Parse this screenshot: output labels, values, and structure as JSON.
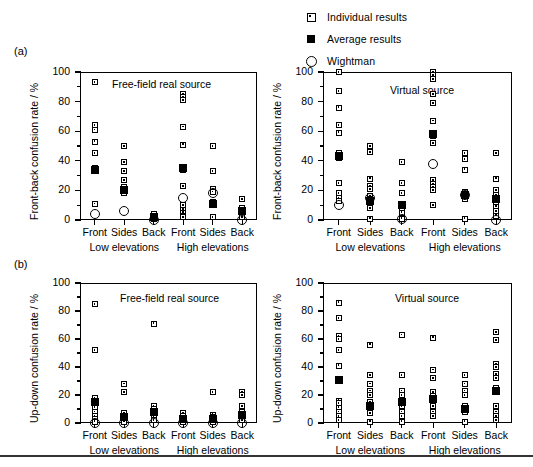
{
  "legend": {
    "items": [
      {
        "icon": "open-square-dot-icon",
        "label": "Individual results"
      },
      {
        "icon": "filled-square-icon",
        "label": "Average results"
      },
      {
        "icon": "open-circle-icon",
        "label": "Wightman"
      }
    ]
  },
  "panels": [
    {
      "tag": "(a)"
    },
    {
      "tag": "(b)"
    }
  ],
  "axis": {
    "yticks": [
      "0",
      "20",
      "40",
      "60",
      "80",
      "100"
    ],
    "categories": [
      "Front",
      "Sides",
      "Back",
      "Front",
      "Sides",
      "Back"
    ],
    "groups": [
      "Low elevations",
      "High elevations"
    ],
    "ylabel_fb": "Front-back confusion rate / %",
    "ylabel_ud": "Up-down confusion rate / %"
  },
  "titles": {
    "real": "Free-field real source",
    "virtual": "Virtual source"
  },
  "chart_data": [
    {
      "id": "a-left",
      "type": "scatter",
      "panel": "(a)",
      "title": "Free-field real source",
      "xlabel": "",
      "ylabel": "Front-back confusion rate / %",
      "ylim": [
        0,
        100
      ],
      "yticks": [
        0,
        20,
        40,
        60,
        80,
        100
      ],
      "grid": false,
      "categories": [
        "Front",
        "Sides",
        "Back",
        "Front",
        "Sides",
        "Back"
      ],
      "groups": [
        "Low elevations",
        "High elevations"
      ],
      "series": [
        {
          "name": "Individual results",
          "values_by_category": [
            [
              93,
              64,
              61,
              53,
              45,
              35,
              33,
              11
            ],
            [
              50,
              39,
              33,
              27,
              22,
              21,
              19,
              18
            ],
            [
              4,
              3,
              2,
              1
            ],
            [
              85,
              83,
              81,
              63,
              51,
              36,
              34,
              23,
              10,
              7,
              5,
              3,
              2
            ],
            [
              50,
              33,
              21,
              19,
              12,
              10,
              2
            ],
            [
              14,
              8,
              6,
              5,
              4,
              2
            ]
          ]
        },
        {
          "name": "Average results",
          "values_by_category": [
            [
              34
            ],
            [
              20
            ],
            [
              2
            ],
            [
              35
            ],
            [
              11
            ],
            [
              6
            ]
          ]
        },
        {
          "name": "Wightman",
          "values_by_category": [
            [
              4
            ],
            [
              6
            ],
            [
              0
            ],
            [
              15
            ],
            [
              18
            ],
            [
              0
            ]
          ]
        }
      ]
    },
    {
      "id": "a-right",
      "type": "scatter",
      "panel": "(a)",
      "title": "Virtual source",
      "xlabel": "",
      "ylabel": "Front-back confusion rate / %",
      "ylim": [
        0,
        100
      ],
      "yticks": [
        0,
        20,
        40,
        60,
        80,
        100
      ],
      "grid": false,
      "categories": [
        "Front",
        "Sides",
        "Back",
        "Front",
        "Sides",
        "Back"
      ],
      "groups": [
        "Low elevations",
        "High elevations"
      ],
      "series": [
        {
          "name": "Individual results",
          "values_by_category": [
            [
              100,
              87,
              76,
              64,
              59,
              45,
              42,
              25,
              18,
              15,
              13
            ],
            [
              50,
              46,
              28,
              23,
              21,
              16,
              14,
              11,
              8,
              1
            ],
            [
              39,
              25,
              18,
              11,
              8,
              5,
              1
            ],
            [
              100,
              98,
              95,
              85,
              79,
              67,
              59,
              57,
              52,
              27,
              24,
              22,
              20,
              10
            ],
            [
              45,
              41,
              34,
              19,
              16,
              14,
              1
            ],
            [
              45,
              28,
              20,
              17,
              15,
              12,
              9,
              6,
              3
            ]
          ]
        },
        {
          "name": "Average results",
          "values_by_category": [
            [
              43
            ],
            [
              13
            ],
            [
              10
            ],
            [
              58
            ],
            [
              17
            ],
            [
              14
            ]
          ]
        },
        {
          "name": "Wightman",
          "values_by_category": [
            [
              10
            ],
            [
              15
            ],
            [
              1
            ],
            [
              38
            ],
            [
              17
            ],
            [
              0
            ]
          ]
        }
      ]
    },
    {
      "id": "b-left",
      "type": "scatter",
      "panel": "(b)",
      "title": "Free-field real source",
      "xlabel": "",
      "ylabel": "Up-down confusion rate / %",
      "ylim": [
        0,
        100
      ],
      "yticks": [
        0,
        20,
        40,
        60,
        80,
        100
      ],
      "grid": false,
      "categories": [
        "Front",
        "Sides",
        "Back",
        "Front",
        "Sides",
        "Back"
      ],
      "groups": [
        "Low elevations",
        "High elevations"
      ],
      "series": [
        {
          "name": "Individual results",
          "values_by_category": [
            [
              85,
              52,
              18,
              16,
              14,
              11,
              8,
              5,
              3,
              1
            ],
            [
              28,
              22,
              7,
              5,
              3,
              1
            ],
            [
              71,
              12,
              10,
              8,
              6,
              4,
              2
            ],
            [
              7,
              5,
              3,
              1
            ],
            [
              22,
              6,
              4,
              2,
              1
            ],
            [
              22,
              20,
              12,
              8,
              6,
              4,
              2
            ]
          ]
        },
        {
          "name": "Average results",
          "values_by_category": [
            [
              15
            ],
            [
              4
            ],
            [
              8
            ],
            [
              3
            ],
            [
              3
            ],
            [
              6
            ]
          ]
        },
        {
          "name": "Wightman",
          "values_by_category": [
            [
              0
            ],
            [
              0
            ],
            [
              0
            ],
            [
              0
            ],
            [
              0
            ],
            [
              0
            ]
          ]
        }
      ]
    },
    {
      "id": "b-right",
      "type": "scatter",
      "panel": "(b)",
      "title": "Virtual source",
      "xlabel": "",
      "ylabel": "Up-down confusion rate / %",
      "ylim": [
        0,
        100
      ],
      "yticks": [
        0,
        20,
        40,
        60,
        80,
        100
      ],
      "grid": false,
      "categories": [
        "Front",
        "Sides",
        "Back",
        "Front",
        "Sides",
        "Back"
      ],
      "groups": [
        "Low elevations",
        "High elevations"
      ],
      "series": [
        {
          "name": "Individual results",
          "values_by_category": [
            [
              86,
              75,
              62,
              60,
              52,
              41,
              16,
              14,
              11,
              8,
              5,
              2
            ],
            [
              56,
              34,
              28,
              23,
              20,
              15,
              10,
              7,
              1
            ],
            [
              63,
              34,
              23,
              20,
              12,
              8,
              5,
              1
            ],
            [
              61,
              38,
              32,
              22,
              19,
              12,
              8,
              5
            ],
            [
              34,
              28,
              23,
              20,
              12,
              8,
              1
            ],
            [
              65,
              59,
              42,
              40,
              35,
              32,
              25,
              12,
              8,
              5,
              2
            ]
          ]
        },
        {
          "name": "Average results",
          "values_by_category": [
            [
              31
            ],
            [
              12
            ],
            [
              15
            ],
            [
              17
            ],
            [
              10
            ],
            [
              23
            ]
          ]
        },
        {
          "name": "Wightman",
          "values_by_category": [
            [],
            [],
            [],
            [],
            [],
            []
          ]
        }
      ]
    }
  ]
}
